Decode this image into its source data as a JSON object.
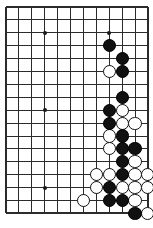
{
  "figure": {
    "kind": "go-board-diagram",
    "game": "Go",
    "colors": {
      "board_background": "#ffffff",
      "grid_line": "#2b2b2b",
      "black_stone": "#111111",
      "white_stone": "#ffffff",
      "white_stone_outline": "#111111"
    }
  },
  "board": {
    "visible_columns": 12,
    "visible_rows": 17,
    "origin_x": 6,
    "origin_y": 7,
    "spacing": 12.9,
    "stone_radius": 6.6,
    "edges": {
      "left": true,
      "top": true,
      "right": true,
      "bottom": true
    },
    "star_points": [
      {
        "col": 3,
        "row": 2
      },
      {
        "col": 8,
        "row": 2
      },
      {
        "col": 3,
        "row": 8
      },
      {
        "col": 3,
        "row": 14
      }
    ],
    "stones": [
      {
        "col": 8,
        "row": 3,
        "color": "black"
      },
      {
        "col": 9,
        "row": 4,
        "color": "black"
      },
      {
        "col": 8,
        "row": 5,
        "color": "white"
      },
      {
        "col": 9,
        "row": 5,
        "color": "black"
      },
      {
        "col": 9,
        "row": 7,
        "color": "black"
      },
      {
        "col": 8,
        "row": 8,
        "color": "black"
      },
      {
        "col": 9,
        "row": 8,
        "color": "white"
      },
      {
        "col": 8,
        "row": 9,
        "color": "black"
      },
      {
        "col": 9,
        "row": 9,
        "color": "white"
      },
      {
        "col": 10,
        "row": 9,
        "color": "white"
      },
      {
        "col": 8,
        "row": 10,
        "color": "white"
      },
      {
        "col": 9,
        "row": 10,
        "color": "black"
      },
      {
        "col": 8,
        "row": 11,
        "color": "white"
      },
      {
        "col": 9,
        "row": 11,
        "color": "black"
      },
      {
        "col": 10,
        "row": 11,
        "color": "black"
      },
      {
        "col": 9,
        "row": 12,
        "color": "black"
      },
      {
        "col": 10,
        "row": 12,
        "color": "white"
      },
      {
        "col": 7,
        "row": 13,
        "color": "white"
      },
      {
        "col": 8,
        "row": 13,
        "color": "white"
      },
      {
        "col": 9,
        "row": 13,
        "color": "black"
      },
      {
        "col": 10,
        "row": 13,
        "color": "white"
      },
      {
        "col": 11,
        "row": 13,
        "color": "white"
      },
      {
        "col": 7,
        "row": 14,
        "color": "white"
      },
      {
        "col": 8,
        "row": 14,
        "color": "black"
      },
      {
        "col": 9,
        "row": 14,
        "color": "white"
      },
      {
        "col": 10,
        "row": 14,
        "color": "white"
      },
      {
        "col": 11,
        "row": 14,
        "color": "white"
      },
      {
        "col": 6,
        "row": 15,
        "color": "white"
      },
      {
        "col": 8,
        "row": 15,
        "color": "black"
      },
      {
        "col": 9,
        "row": 15,
        "color": "black"
      },
      {
        "col": 10,
        "row": 15,
        "color": "white"
      },
      {
        "col": 10,
        "row": 16,
        "color": "black"
      },
      {
        "col": 11,
        "row": 16,
        "color": "white"
      }
    ]
  }
}
